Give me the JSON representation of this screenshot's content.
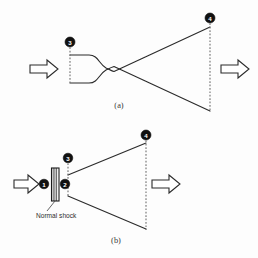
{
  "figure": {
    "background_color": "#fdfdfd",
    "line_color": "#2b2b2b",
    "dashed_color": "#6a6a6a",
    "marker_fill": "#111111",
    "marker_text_color": "#ffffff"
  },
  "panels": [
    {
      "id": "panel-a",
      "caption": "(a)",
      "description": "Converging-diverging nozzle, isentropic expansion",
      "inlet_arrow_label": "",
      "outlet_arrow_label": "",
      "stations": [
        {
          "id": "a-station-3",
          "label": "3",
          "position": "nozzle-inlet-top"
        },
        {
          "id": "a-station-4",
          "label": "4",
          "position": "nozzle-exit-top"
        }
      ]
    },
    {
      "id": "panel-b",
      "caption": "(b)",
      "description": "Diverging nozzle with a normal shock at the inlet",
      "inlet_arrow_label": "",
      "outlet_arrow_label": "",
      "shock_label": "Normal shock",
      "stations": [
        {
          "id": "b-station-1",
          "label": "1",
          "position": "upstream-of-shock"
        },
        {
          "id": "b-station-2",
          "label": "2",
          "position": "downstream-of-shock"
        },
        {
          "id": "b-station-3",
          "label": "3",
          "position": "nozzle-inlet-top"
        },
        {
          "id": "b-station-4",
          "label": "4",
          "position": "nozzle-exit-top"
        }
      ]
    }
  ]
}
